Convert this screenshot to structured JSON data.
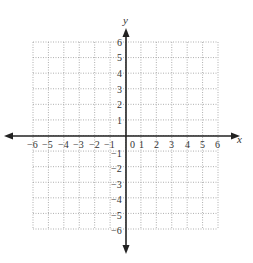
{
  "graph": {
    "x_axis_label": "x",
    "y_axis_label": "y",
    "x_range": [
      -6,
      6
    ],
    "y_range": [
      -6,
      6
    ],
    "x_ticks_negative": [
      "−6",
      "−5",
      "−4",
      "−3",
      "−2",
      "−1"
    ],
    "x_ticks_positive": [
      "1",
      "2",
      "3",
      "4",
      "5",
      "6"
    ],
    "origin_label": "0",
    "y_ticks_positive": [
      "6",
      "5",
      "4",
      "3",
      "2",
      "1"
    ],
    "y_ticks_negative": [
      "−1",
      "−2",
      "−3",
      "−4",
      "−5",
      "−6"
    ],
    "grid": "dotted",
    "colors": {
      "axis": "#222222",
      "grid": "#999999",
      "text": "#333333"
    }
  }
}
